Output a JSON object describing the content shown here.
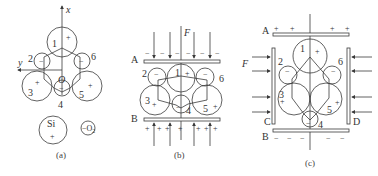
{
  "panels": {
    "a": {
      "caption": "(a)",
      "axis_x": "x",
      "axis_y": "y",
      "origin": "O",
      "atoms": [
        {
          "n": "1",
          "sign": "+"
        },
        {
          "n": "2",
          "sign": "−"
        },
        {
          "n": "3",
          "sign": "+"
        },
        {
          "n": "4",
          "sign": "−"
        },
        {
          "n": "5",
          "sign": "+"
        },
        {
          "n": "6",
          "sign": "−"
        }
      ],
      "legend": {
        "si": "Si",
        "si_sign": "+",
        "o": "−O",
        "o_sub": "2"
      }
    },
    "b": {
      "caption": "(b)",
      "force": "F",
      "plate_top": "A",
      "plate_bottom": "B",
      "top_charges": "−",
      "bottom_charges": "+",
      "atoms": [
        {
          "n": "1",
          "sign": "+"
        },
        {
          "n": "2",
          "sign": "−"
        },
        {
          "n": "3",
          "sign": "+"
        },
        {
          "n": "4",
          "sign": "−"
        },
        {
          "n": "5",
          "sign": "+"
        },
        {
          "n": "6",
          "sign": "−"
        }
      ]
    },
    "c": {
      "caption": "(c)",
      "force": "F",
      "plate_top": "A",
      "plate_bottom": "B",
      "plate_left": "C",
      "plate_right": "D",
      "top_charges": "+",
      "bottom_charges": "−",
      "atoms": [
        {
          "n": "1",
          "sign": "+"
        },
        {
          "n": "2",
          "sign": "−"
        },
        {
          "n": "3",
          "sign": "+"
        },
        {
          "n": "4",
          "sign": "−"
        },
        {
          "n": "5",
          "sign": "+"
        },
        {
          "n": "6",
          "sign": "−"
        }
      ]
    }
  }
}
